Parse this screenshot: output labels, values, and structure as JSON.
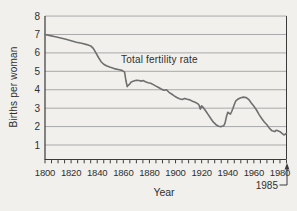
{
  "figure": {
    "background": "#f2f0ec",
    "axis_color": "#3a3a3a",
    "grid_color": "#a9a9a9",
    "line_color": "#6f6f6f",
    "text_color": "#2f2f2f"
  },
  "chart_data": {
    "type": "line",
    "xlabel": "Year",
    "ylabel": "Births per woman",
    "annotations": {
      "series_label": "Total fertility rate",
      "end_year": "1985"
    },
    "x_range": [
      1800,
      1985
    ],
    "ylim": [
      0,
      8
    ],
    "grid": true,
    "y_ticks": [
      1,
      2,
      3,
      4,
      5,
      6,
      7,
      8
    ],
    "x_tick_step": 5,
    "x_label_ticks": [
      1800,
      1820,
      1840,
      1860,
      1880,
      1900,
      1920,
      1940,
      1960,
      1980
    ],
    "series": [
      {
        "name": "Total fertility rate",
        "points": [
          [
            1800,
            7.0
          ],
          [
            1804,
            6.94
          ],
          [
            1808,
            6.88
          ],
          [
            1812,
            6.81
          ],
          [
            1816,
            6.74
          ],
          [
            1820,
            6.66
          ],
          [
            1824,
            6.58
          ],
          [
            1828,
            6.52
          ],
          [
            1832,
            6.45
          ],
          [
            1835,
            6.38
          ],
          [
            1837,
            6.25
          ],
          [
            1839,
            6.0
          ],
          [
            1841,
            5.75
          ],
          [
            1843,
            5.52
          ],
          [
            1845,
            5.38
          ],
          [
            1847,
            5.3
          ],
          [
            1850,
            5.22
          ],
          [
            1853,
            5.15
          ],
          [
            1856,
            5.1
          ],
          [
            1859,
            5.05
          ],
          [
            1861,
            4.95
          ],
          [
            1862,
            4.5
          ],
          [
            1863,
            4.17
          ],
          [
            1864,
            4.25
          ],
          [
            1865,
            4.32
          ],
          [
            1866,
            4.42
          ],
          [
            1868,
            4.47
          ],
          [
            1870,
            4.52
          ],
          [
            1872,
            4.5
          ],
          [
            1874,
            4.47
          ],
          [
            1875,
            4.5
          ],
          [
            1877,
            4.43
          ],
          [
            1879,
            4.38
          ],
          [
            1881,
            4.35
          ],
          [
            1883,
            4.28
          ],
          [
            1885,
            4.2
          ],
          [
            1887,
            4.12
          ],
          [
            1889,
            4.04
          ],
          [
            1891,
            3.97
          ],
          [
            1893,
            4.0
          ],
          [
            1895,
            3.86
          ],
          [
            1897,
            3.77
          ],
          [
            1899,
            3.67
          ],
          [
            1901,
            3.58
          ],
          [
            1903,
            3.51
          ],
          [
            1905,
            3.47
          ],
          [
            1907,
            3.53
          ],
          [
            1909,
            3.48
          ],
          [
            1911,
            3.45
          ],
          [
            1913,
            3.38
          ],
          [
            1915,
            3.32
          ],
          [
            1917,
            3.25
          ],
          [
            1918,
            3.17
          ],
          [
            1919,
            2.95
          ],
          [
            1920,
            3.12
          ],
          [
            1921,
            3.05
          ],
          [
            1923,
            2.86
          ],
          [
            1925,
            2.65
          ],
          [
            1927,
            2.44
          ],
          [
            1929,
            2.24
          ],
          [
            1931,
            2.1
          ],
          [
            1933,
            2.02
          ],
          [
            1935,
            2.0
          ],
          [
            1937,
            2.05
          ],
          [
            1938,
            2.2
          ],
          [
            1939,
            2.55
          ],
          [
            1940,
            2.78
          ],
          [
            1941,
            2.72
          ],
          [
            1942,
            2.68
          ],
          [
            1943,
            2.82
          ],
          [
            1944,
            3.0
          ],
          [
            1945,
            3.2
          ],
          [
            1946,
            3.38
          ],
          [
            1948,
            3.5
          ],
          [
            1950,
            3.57
          ],
          [
            1952,
            3.6
          ],
          [
            1954,
            3.58
          ],
          [
            1956,
            3.48
          ],
          [
            1958,
            3.28
          ],
          [
            1960,
            3.1
          ],
          [
            1962,
            2.9
          ],
          [
            1964,
            2.65
          ],
          [
            1966,
            2.44
          ],
          [
            1968,
            2.25
          ],
          [
            1970,
            2.1
          ],
          [
            1972,
            1.9
          ],
          [
            1974,
            1.77
          ],
          [
            1976,
            1.73
          ],
          [
            1977,
            1.8
          ],
          [
            1978,
            1.78
          ],
          [
            1980,
            1.72
          ],
          [
            1982,
            1.6
          ],
          [
            1983,
            1.55
          ],
          [
            1984,
            1.58
          ],
          [
            1985,
            1.65
          ]
        ]
      }
    ]
  }
}
